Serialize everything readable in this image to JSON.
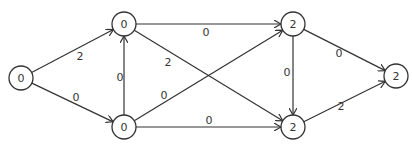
{
  "diagram": {
    "type": "directed-graph",
    "nodes": [
      {
        "id": "A",
        "label": "0",
        "x": 21,
        "y": 78
      },
      {
        "id": "B",
        "label": "0",
        "x": 124,
        "y": 24
      },
      {
        "id": "C",
        "label": "0",
        "x": 124,
        "y": 127
      },
      {
        "id": "D",
        "label": "2",
        "x": 293,
        "y": 24
      },
      {
        "id": "E",
        "label": "2",
        "x": 293,
        "y": 127
      },
      {
        "id": "F",
        "label": "2",
        "x": 396,
        "y": 76
      }
    ],
    "edges": [
      {
        "from": "A",
        "to": "B",
        "weight": "2",
        "lx": 80,
        "ly": 56
      },
      {
        "from": "A",
        "to": "C",
        "weight": "0",
        "lx": 76,
        "ly": 97
      },
      {
        "from": "C",
        "to": "B",
        "weight": "0",
        "lx": 120,
        "ly": 77
      },
      {
        "from": "B",
        "to": "D",
        "weight": "0",
        "lx": 206,
        "ly": 32
      },
      {
        "from": "B",
        "to": "E",
        "weight": "2",
        "lx": 168,
        "ly": 62
      },
      {
        "from": "C",
        "to": "D",
        "weight": "0",
        "lx": 164,
        "ly": 95
      },
      {
        "from": "C",
        "to": "E",
        "weight": "0",
        "lx": 209,
        "ly": 120
      },
      {
        "from": "D",
        "to": "E",
        "weight": "0",
        "lx": 287,
        "ly": 72
      },
      {
        "from": "D",
        "to": "F",
        "weight": "0",
        "lx": 339,
        "ly": 53
      },
      {
        "from": "E",
        "to": "F",
        "weight": "2",
        "lx": 341,
        "ly": 106
      }
    ],
    "node_radius": 12,
    "caption": ""
  }
}
